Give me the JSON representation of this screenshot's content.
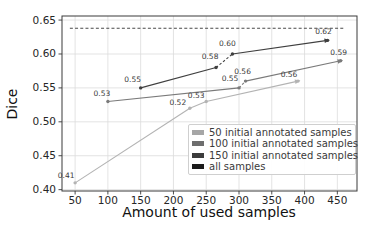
{
  "figure": {
    "background": "#ffffff"
  },
  "chart_data": {
    "type": "line",
    "title": "",
    "xlabel": "Amount of used samples",
    "ylabel": "Dice",
    "xlim": [
      30,
      480
    ],
    "ylim": [
      0.398,
      0.656
    ],
    "xticks": [
      50,
      100,
      150,
      200,
      250,
      300,
      350,
      400,
      450
    ],
    "yticks": [
      0.4,
      0.45,
      0.5,
      0.55,
      0.6,
      0.65
    ],
    "grid": true,
    "grid_color": "#dcdcdc",
    "spine_color": "#3a3a3a",
    "tick_label_color": "#262626",
    "annotation_color": "#3a3a3a",
    "legend_position": "lower right",
    "series": [
      {
        "name": "50 initial annotated samples",
        "color": "#b3b3b3",
        "style": "solid",
        "end_arrow": true,
        "dashed_segments": [],
        "points": [
          [
            50,
            0.41
          ],
          [
            225,
            0.52
          ],
          [
            250,
            0.53
          ],
          [
            390,
            0.56
          ]
        ]
      },
      {
        "name": "100 initial annotated samples",
        "color": "#7a7a7a",
        "style": "solid",
        "end_arrow": true,
        "dashed_segments": [
          1
        ],
        "points": [
          [
            100,
            0.53
          ],
          [
            300,
            0.55
          ],
          [
            310,
            0.56
          ],
          [
            455,
            0.59
          ]
        ]
      },
      {
        "name": "150 initial annotated samples",
        "color": "#3f3f3f",
        "style": "solid",
        "end_arrow": true,
        "dashed_segments": [
          1
        ],
        "points": [
          [
            150,
            0.55
          ],
          [
            265,
            0.58
          ],
          [
            290,
            0.6
          ],
          [
            435,
            0.62
          ]
        ]
      },
      {
        "name": "all samples",
        "color": "#4a4a4a",
        "style": "dashed",
        "end_arrow": false,
        "dashed_segments": [],
        "points": [
          [
            42,
            0.638
          ],
          [
            462,
            0.638
          ]
        ]
      }
    ],
    "annotations": [
      {
        "text": "0.41",
        "x": 50,
        "y": 0.41,
        "dx": -9,
        "dy": -7
      },
      {
        "text": "0.52",
        "x": 225,
        "y": 0.52,
        "dx": -12,
        "dy": -6
      },
      {
        "text": "0.53",
        "x": 250,
        "y": 0.53,
        "dx": -10,
        "dy": -6
      },
      {
        "text": "0.56",
        "x": 390,
        "y": 0.56,
        "dx": -9,
        "dy": -7
      },
      {
        "text": "0.53",
        "x": 100,
        "y": 0.53,
        "dx": -6,
        "dy": -8
      },
      {
        "text": "0.55",
        "x": 300,
        "y": 0.55,
        "dx": -9,
        "dy": -9
      },
      {
        "text": "0.56",
        "x": 310,
        "y": 0.56,
        "dx": -3,
        "dy": -10
      },
      {
        "text": "0.59",
        "x": 455,
        "y": 0.59,
        "dx": -2,
        "dy": -8
      },
      {
        "text": "0.55",
        "x": 150,
        "y": 0.55,
        "dx": -8,
        "dy": -8
      },
      {
        "text": "0.58",
        "x": 265,
        "y": 0.58,
        "dx": -6,
        "dy": -11
      },
      {
        "text": "0.60",
        "x": 290,
        "y": 0.6,
        "dx": -5,
        "dy": -11
      },
      {
        "text": "0.62",
        "x": 435,
        "y": 0.62,
        "dx": -4,
        "dy": -9
      }
    ],
    "legend": [
      {
        "label": "50 initial annotated samples",
        "color": "#a6a6a6"
      },
      {
        "label": "100 initial annotated samples",
        "color": "#6e6e6e"
      },
      {
        "label": "150 initial annotated samples",
        "color": "#3c3c3c"
      },
      {
        "label": "all samples",
        "color": "#1b1b1b"
      }
    ]
  }
}
